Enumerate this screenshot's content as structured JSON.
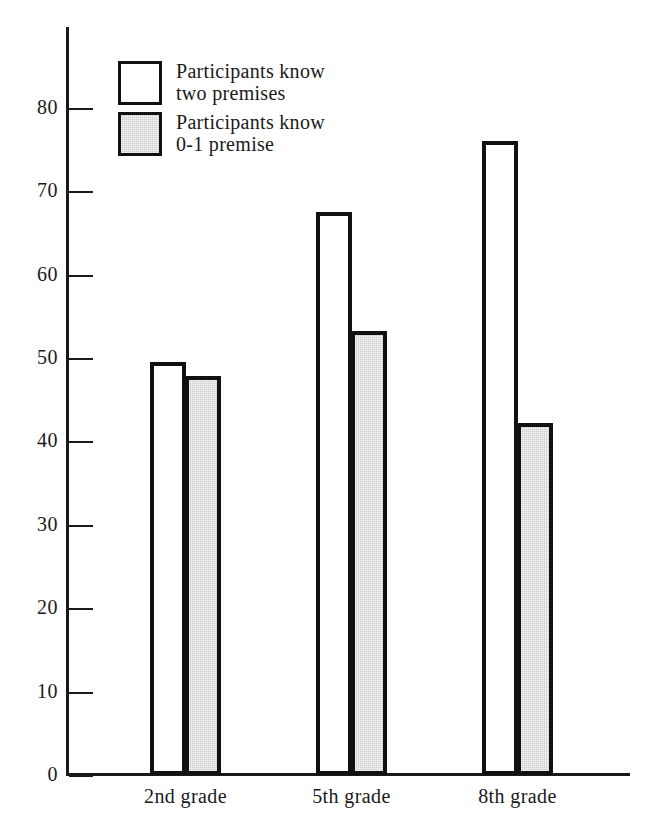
{
  "chart_data": {
    "type": "bar",
    "title": "",
    "subtitle": "",
    "xlabel": "",
    "ylabel": "",
    "categories": [
      "2nd grade",
      "5th grade",
      "8th grade"
    ],
    "series": [
      {
        "name": "Participants know two premises",
        "fill": "white",
        "values": [
          49.5,
          67.5,
          76.0
        ]
      },
      {
        "name": "Participants know 0-1 premise",
        "fill": "#cccccc",
        "values": [
          47.8,
          53.2,
          42.2
        ]
      }
    ],
    "ylim": [
      0,
      88
    ],
    "yticks": [
      0,
      10,
      20,
      30,
      40,
      50,
      60,
      70,
      80
    ],
    "ytick_labels": [
      "0",
      "10",
      "20",
      "30",
      "40",
      "50",
      "60",
      "70",
      "80"
    ],
    "grid": false,
    "legend_position": "top-left",
    "annotations": []
  },
  "legend": {
    "entries": [
      {
        "swatch": "white-square",
        "line1": "Participants know",
        "line2": "two premises"
      },
      {
        "swatch": "shaded-square",
        "line1": "Participants know",
        "line2": "0-1 premise"
      }
    ]
  },
  "colors": {
    "axis": "#1a1a1a",
    "bar_outline": "#111111",
    "bar_light_fill": "#ffffff",
    "bar_shaded_fill": "#cccccc",
    "background": "#ffffff"
  }
}
